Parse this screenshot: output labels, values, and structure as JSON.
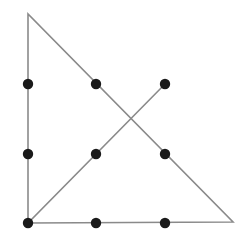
{
  "diagram": {
    "title": "",
    "colors": {
      "background": "#ffffff",
      "line": "#8a8a8a",
      "dot": "#1a1a1a"
    },
    "line_width": 1.6,
    "dot_radius": 5.2,
    "dots": [
      {
        "id": "r1c1",
        "x": 28,
        "y": 84
      },
      {
        "id": "r1c2",
        "x": 96,
        "y": 84
      },
      {
        "id": "r1c3",
        "x": 165,
        "y": 84
      },
      {
        "id": "r2c1",
        "x": 28,
        "y": 154
      },
      {
        "id": "r2c2",
        "x": 96,
        "y": 154
      },
      {
        "id": "r2c3",
        "x": 165,
        "y": 154
      },
      {
        "id": "r3c1",
        "x": 28,
        "y": 223
      },
      {
        "id": "r3c2",
        "x": 96,
        "y": 223
      },
      {
        "id": "r3c3",
        "x": 165,
        "y": 223
      }
    ],
    "path": [
      {
        "x": 165,
        "y": 84
      },
      {
        "x": 28,
        "y": 223
      },
      {
        "x": 28,
        "y": 14
      },
      {
        "x": 233,
        "y": 222
      },
      {
        "x": 28,
        "y": 223
      }
    ]
  }
}
